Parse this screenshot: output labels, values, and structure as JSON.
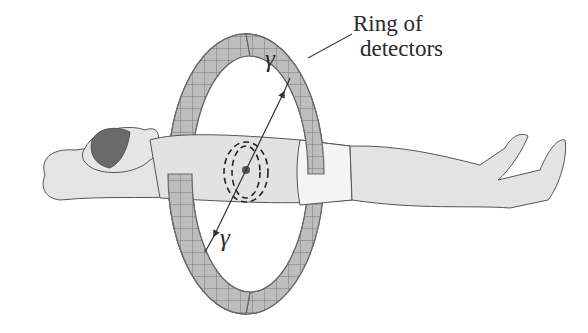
{
  "figure": {
    "labels": {
      "ring_line1": "Ring of",
      "ring_line2": "detectors",
      "gamma_top": "γ",
      "gamma_bottom": "γ"
    },
    "colors": {
      "background": "#ffffff",
      "ring_fill": "#b8b8b8",
      "ring_cell_lines": "#6e6e6e",
      "body_fill": "#e2e2e2",
      "body_outline": "#555555",
      "hair": "#6a6a6a",
      "gamma_line": "#333333",
      "source_dot": "#555555"
    }
  }
}
